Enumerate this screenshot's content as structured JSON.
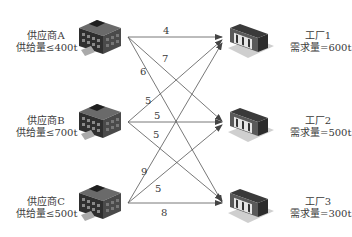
{
  "suppliers": [
    {
      "name": "供应商A",
      "capacity": "供给量≤400t"
    },
    {
      "name": "供应商B",
      "capacity": "供给量≤700t"
    },
    {
      "name": "供应商C",
      "capacity": "供给量≤500t"
    }
  ],
  "factories": [
    {
      "name": "工厂1",
      "demand": "需求量=600t"
    },
    {
      "name": "工厂2",
      "demand": "需求量=500t"
    },
    {
      "name": "工厂3",
      "demand": "需求量=300t"
    }
  ],
  "costs": {
    "A_1": "4",
    "A_2": "7",
    "A_3": "6",
    "B_1": "5",
    "B_2": "5",
    "B_3": "5",
    "C_1": "9",
    "C_2": "5",
    "C_3": "8"
  },
  "icons": {
    "supplier": "office-building-icon",
    "factory": "factory-building-icon"
  }
}
